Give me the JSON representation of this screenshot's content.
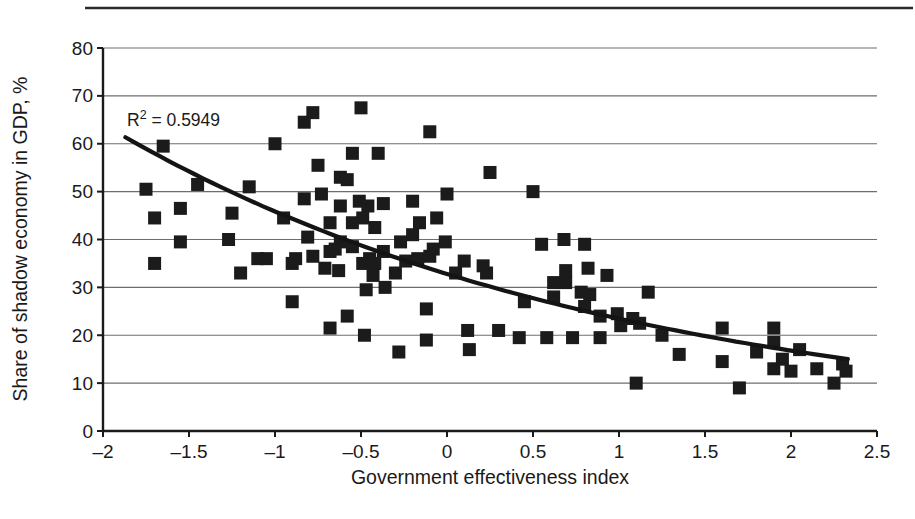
{
  "chart_data": {
    "type": "scatter",
    "title": "",
    "xlabel": "Government effectiveness index",
    "ylabel": "Share of shadow economy in GDP, %",
    "xlim": [
      -2,
      2.5
    ],
    "ylim": [
      0,
      80
    ],
    "x_ticks": [
      -2,
      -1.5,
      -1,
      -0.5,
      0,
      0.5,
      1,
      1.5,
      2,
      2.5
    ],
    "x_tick_labels": [
      "–2",
      "–1.5",
      "–1",
      "–0.5",
      "0",
      "0.5",
      "1",
      "1.5",
      "2",
      "2.5"
    ],
    "y_ticks": [
      0,
      10,
      20,
      30,
      40,
      50,
      60,
      70,
      80
    ],
    "y_tick_labels": [
      "0",
      "10",
      "20",
      "30",
      "40",
      "50",
      "60",
      "70",
      "80"
    ],
    "grid": "horizontal",
    "legend": "none",
    "annotation": {
      "prefix": "R",
      "sup": "2",
      "suffix": " = 0.5949",
      "r_squared_value": 0.5949
    },
    "marker": {
      "shape": "square",
      "size": 13,
      "color": "#1b1b1b"
    },
    "trend": {
      "type": "exponential",
      "model": "y = a * exp(b * x)",
      "a": 32.8,
      "b": -0.335,
      "x_start": -1.87,
      "x_end": 2.33,
      "color": "#141414",
      "width": 4.2
    },
    "points": [
      [
        -1.65,
        59.5
      ],
      [
        -1.75,
        50.5
      ],
      [
        -1.45,
        51.5
      ],
      [
        -1.55,
        46.5
      ],
      [
        -1.7,
        44.5
      ],
      [
        -1.25,
        45.5
      ],
      [
        -1.55,
        39.5
      ],
      [
        -1.27,
        40
      ],
      [
        -1.7,
        35
      ],
      [
        -1.15,
        51
      ],
      [
        -1.0,
        60
      ],
      [
        -1.1,
        36
      ],
      [
        -1.05,
        36
      ],
      [
        -1.2,
        33
      ],
      [
        -0.95,
        44.5
      ],
      [
        -0.9,
        35
      ],
      [
        -0.9,
        27
      ],
      [
        -0.78,
        66.5
      ],
      [
        -0.83,
        64.5
      ],
      [
        -0.5,
        67.5
      ],
      [
        -0.75,
        55.5
      ],
      [
        -0.55,
        58
      ],
      [
        -0.4,
        58
      ],
      [
        -0.62,
        53
      ],
      [
        -0.58,
        52.5
      ],
      [
        -0.73,
        49.5
      ],
      [
        -0.83,
        48.5
      ],
      [
        -0.62,
        47
      ],
      [
        -0.51,
        48
      ],
      [
        -0.46,
        47
      ],
      [
        -0.37,
        47.5
      ],
      [
        -0.49,
        44.5
      ],
      [
        -0.68,
        43.5
      ],
      [
        -0.55,
        43.5
      ],
      [
        -0.42,
        42.5
      ],
      [
        -0.81,
        40.5
      ],
      [
        -0.62,
        39.5
      ],
      [
        -0.55,
        38.5
      ],
      [
        -0.68,
        37.5
      ],
      [
        -0.78,
        36.5
      ],
      [
        -0.88,
        36
      ],
      [
        -0.71,
        34
      ],
      [
        -0.63,
        33.5
      ],
      [
        -0.65,
        38
      ],
      [
        -0.45,
        36
      ],
      [
        -0.37,
        37.5
      ],
      [
        -0.27,
        39.5
      ],
      [
        -0.2,
        41
      ],
      [
        -0.24,
        35.5
      ],
      [
        -0.43,
        32.5
      ],
      [
        -0.3,
        33
      ],
      [
        -0.47,
        29.5
      ],
      [
        -0.36,
        30
      ],
      [
        -0.49,
        35
      ],
      [
        -0.42,
        35
      ],
      [
        -0.1,
        62.5
      ],
      [
        0.25,
        54
      ],
      [
        -0.16,
        43.5
      ],
      [
        -0.06,
        44.5
      ],
      [
        -0.01,
        39.5
      ],
      [
        -0.2,
        48
      ],
      [
        0,
        49.5
      ],
      [
        -0.17,
        36
      ],
      [
        -0.08,
        38
      ],
      [
        -0.1,
        36.5
      ],
      [
        0.05,
        33
      ],
      [
        0.1,
        35.5
      ],
      [
        0.21,
        34.5
      ],
      [
        0.23,
        33
      ],
      [
        -0.12,
        25.5
      ],
      [
        -0.68,
        21.5
      ],
      [
        -0.58,
        24
      ],
      [
        -0.48,
        20
      ],
      [
        -0.28,
        16.5
      ],
      [
        -0.12,
        19
      ],
      [
        0.12,
        21
      ],
      [
        0.13,
        17
      ],
      [
        0.3,
        21
      ],
      [
        0.42,
        19.5
      ],
      [
        0.5,
        50
      ],
      [
        0.55,
        39
      ],
      [
        0.68,
        40
      ],
      [
        0.8,
        39
      ],
      [
        0.69,
        33.5
      ],
      [
        0.69,
        31
      ],
      [
        0.82,
        34
      ],
      [
        0.62,
        31
      ],
      [
        0.62,
        28
      ],
      [
        0.93,
        32.5
      ],
      [
        0.78,
        29
      ],
      [
        0.83,
        28.5
      ],
      [
        0.8,
        26
      ],
      [
        0.45,
        27
      ],
      [
        0.73,
        19.5
      ],
      [
        0.58,
        19.5
      ],
      [
        0.89,
        19.5
      ],
      [
        0.99,
        24.5
      ],
      [
        0.89,
        24
      ],
      [
        1.17,
        29
      ],
      [
        1.08,
        23.5
      ],
      [
        1.12,
        22.5
      ],
      [
        1.01,
        22
      ],
      [
        1.25,
        20
      ],
      [
        1.35,
        16
      ],
      [
        1.1,
        10
      ],
      [
        1.6,
        21.5
      ],
      [
        1.6,
        14.5
      ],
      [
        1.7,
        9
      ],
      [
        1.8,
        16.5
      ],
      [
        1.9,
        21.5
      ],
      [
        1.9,
        18.5
      ],
      [
        1.95,
        15
      ],
      [
        1.9,
        13
      ],
      [
        2.0,
        12.5
      ],
      [
        2.05,
        17
      ],
      [
        2.15,
        13
      ],
      [
        2.25,
        10
      ],
      [
        2.3,
        14
      ],
      [
        2.32,
        12.5
      ]
    ],
    "colors": {
      "marker": "#1b1b1b",
      "gridline": "#6e6e6e",
      "axis": "#1a1a1a",
      "text": "#1a1a1a",
      "top_rule": "#2a2a2a"
    },
    "layout": {
      "plot_left_px": 103,
      "plot_right_px": 877,
      "plot_top_px": 48,
      "plot_bottom_px": 431
    }
  }
}
